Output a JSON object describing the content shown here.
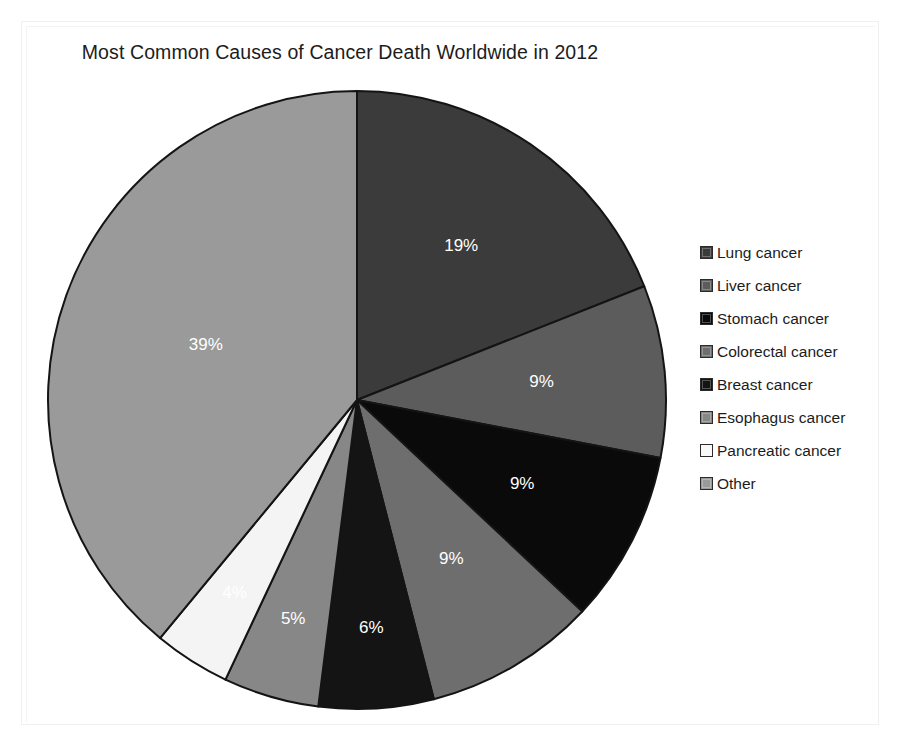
{
  "chart_data": {
    "type": "pie",
    "title": "Most Common Causes of Cancer Death Worldwide in 2012",
    "xlabel": "",
    "ylabel": "",
    "legend_position": "right",
    "grid": false,
    "start_angle_deg": -90,
    "direction": "clockwise",
    "unit": "percent",
    "categories": [
      "Lung cancer",
      "Liver cancer",
      "Stomach cancer",
      "Colorectal cancer",
      "Breast cancer",
      "Esophagus cancer",
      "Pancreatic cancer",
      "Other"
    ],
    "values": [
      19,
      9,
      9,
      9,
      6,
      5,
      4,
      39
    ],
    "value_labels": [
      "19%",
      "9%",
      "9%",
      "9%",
      "6%",
      "5%",
      "4%",
      "39%"
    ],
    "colors": [
      "#3b3b3b",
      "#5c5c5c",
      "#0a0a0a",
      "#6e6e6e",
      "#141414",
      "#878787",
      "#f4f4f4",
      "#9a9a9a"
    ],
    "slice_border_color": "#141414",
    "label_text_color": "#ffffff",
    "slices": [
      {
        "label": "Lung cancer",
        "value": 19,
        "display": "19%",
        "color": "#3b3b3b",
        "label_color": "#ffffff"
      },
      {
        "label": "Liver cancer",
        "value": 9,
        "display": "9%",
        "color": "#5c5c5c",
        "label_color": "#ffffff"
      },
      {
        "label": "Stomach cancer",
        "value": 9,
        "display": "9%",
        "color": "#0a0a0a",
        "label_color": "#ffffff"
      },
      {
        "label": "Colorectal cancer",
        "value": 9,
        "display": "9%",
        "color": "#6e6e6e",
        "label_color": "#ffffff"
      },
      {
        "label": "Breast cancer",
        "value": 6,
        "display": "6%",
        "color": "#141414",
        "label_color": "#ffffff"
      },
      {
        "label": "Esophagus cancer",
        "value": 5,
        "display": "5%",
        "color": "#878787",
        "label_color": "#ffffff"
      },
      {
        "label": "Pancreatic cancer",
        "value": 4,
        "display": "4%",
        "color": "#f4f4f4",
        "label_color": "#ffffff"
      },
      {
        "label": "Other",
        "value": 39,
        "display": "39%",
        "color": "#9a9a9a",
        "label_color": "#ffffff"
      }
    ]
  },
  "legend": {
    "items": [
      {
        "label": "Lung cancer",
        "color": "#3b3b3b"
      },
      {
        "label": "Liver cancer",
        "color": "#5c5c5c"
      },
      {
        "label": "Stomach cancer",
        "color": "#0a0a0a"
      },
      {
        "label": "Colorectal cancer",
        "color": "#6e6e6e"
      },
      {
        "label": "Breast cancer",
        "color": "#141414"
      },
      {
        "label": "Esophagus cancer",
        "color": "#878787"
      },
      {
        "label": "Pancreatic cancer",
        "color": "#f8f8f8"
      },
      {
        "label": "Other",
        "color": "#9a9a9a"
      }
    ]
  }
}
